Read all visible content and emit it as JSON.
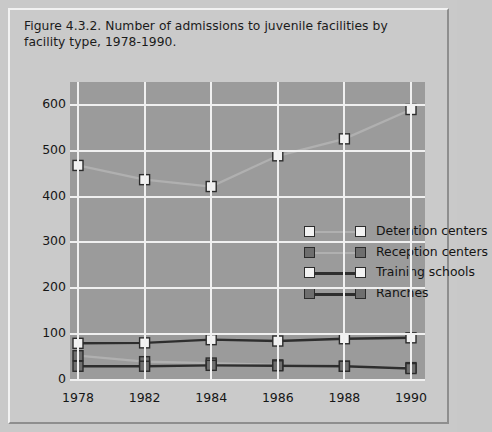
{
  "figure": {
    "title": "Figure 4.3.2. Number of admissions to juvenile facilities by facility type, 1978-1990."
  },
  "colors": {
    "page_background": "#c9c9c9",
    "plot_background": "#9b9b9b",
    "grid": "#f0f0f0",
    "marker_light": "#f2f2f2",
    "marker_dark": "#6e6e6e",
    "line_light": "#b0b0b0",
    "line_dark": "#2e2e2e",
    "text": "#161616"
  },
  "chart_data": {
    "type": "line",
    "title": "Figure 4.3.2. Number of admissions to juvenile facilities by facility type, 1978-1990.",
    "xlabel": "",
    "ylabel": "",
    "categories": [
      "1978",
      "1982",
      "1984",
      "1986",
      "1988",
      "1990"
    ],
    "x": [
      1978,
      1982,
      1984,
      1986,
      1988,
      1990
    ],
    "ylim": [
      0,
      650
    ],
    "yticks": [
      0,
      100,
      200,
      300,
      400,
      500,
      600
    ],
    "ytick_labels": [
      "0",
      "100",
      "200",
      "300",
      "400",
      "500",
      "600"
    ],
    "grid": true,
    "legend_position": "center-right-inside",
    "series": [
      {
        "name": "Detention centers",
        "values": [
          468,
          437,
          422,
          489,
          526,
          590
        ],
        "marker": "square-open-light",
        "line_color": "#b0b0b0",
        "marker_fill": "#f2f2f2"
      },
      {
        "name": "Reception centers",
        "values": [
          53,
          40,
          37,
          33,
          30,
          27
        ],
        "marker": "square-filled-gray",
        "line_color": "#b0b0b0",
        "marker_fill": "#6e6e6e"
      },
      {
        "name": "Training schools",
        "values": [
          80,
          81,
          88,
          85,
          90,
          92
        ],
        "marker": "square-open-light",
        "line_color": "#2e2e2e",
        "marker_fill": "#f2f2f2"
      },
      {
        "name": "Ranches",
        "values": [
          30,
          30,
          32,
          31,
          30,
          25
        ],
        "marker": "square-filled-gray",
        "line_color": "#2e2e2e",
        "marker_fill": "#6e6e6e"
      }
    ]
  }
}
